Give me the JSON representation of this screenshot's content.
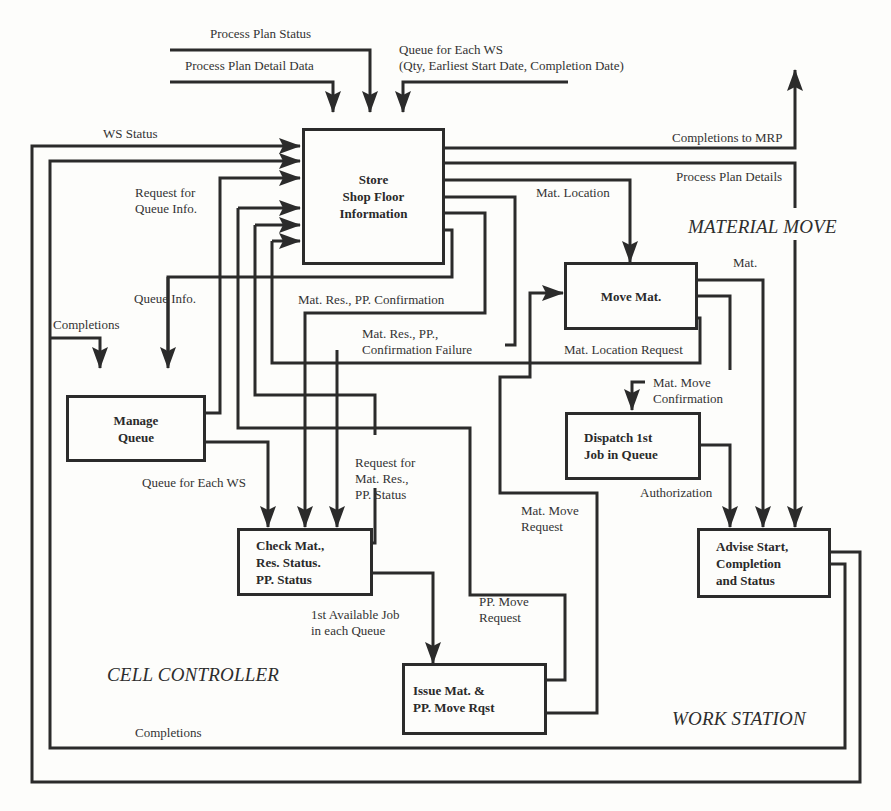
{
  "diagram": {
    "type": "data-flow",
    "regions": {
      "cell_controller": "CELL CONTROLLER",
      "material_move": "MATERIAL MOVE",
      "work_station": "WORK STATION"
    },
    "processes": {
      "store_shop_floor": "Store\nShop Floor\nInformation",
      "manage_queue": "Manage\nQueue",
      "check_status": "Check Mat.,\nRes. Status.\nPP. Status",
      "issue_mat": "Issue Mat. &\nPP. Move Rqst",
      "move_mat": "Move Mat.",
      "dispatch_job": "Dispatch 1st\nJob in Queue",
      "advise_start": "Advise Start,\nCompletion\nand Status"
    },
    "flows": {
      "process_plan_status": "Process Plan Status",
      "process_plan_detail_data": "Process Plan Detail Data",
      "queue_for_each_ws_top": "Queue for Each WS\n(Qty, Earliest Start Date, Completion Date)",
      "ws_status": "WS Status",
      "completions_to_mrp": "Completions to MRP",
      "process_plan_details": "Process Plan Details",
      "request_for_queue_info": "Request for\nQueue Info.",
      "mat_location": "Mat. Location",
      "queue_info": "Queue Info.",
      "completions_left": "Completions",
      "mat_res_pp_confirmation": "Mat. Res., PP. Confirmation",
      "mat_res_pp_confirmation_failure": "Mat. Res., PP.,\nConfirmation Failure",
      "mat": "Mat.",
      "mat_location_request": "Mat. Location Request",
      "mat_move_confirmation": "Mat. Move\nConfirmation",
      "queue_for_each_ws": "Queue for Each WS",
      "request_for_mat_res_pp_status": "Request for\nMat. Res.,\nPP. Status",
      "authorization": "Authorization",
      "mat_move_request": "Mat. Move\nRequest",
      "first_available_job": "1st Available Job\nin each Queue",
      "pp_move_request": "PP. Move\nRequest",
      "completions_bottom": "Completions"
    }
  }
}
